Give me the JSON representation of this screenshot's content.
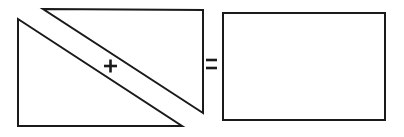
{
  "figure": {
    "background_color": "#ffffff",
    "stroke_color": "#1a1a1a",
    "fill_color": "#ffffff",
    "canvas": {
      "width": 404,
      "height": 137
    },
    "operators": [
      {
        "name": "plus",
        "symbol": "+",
        "x": 110,
        "y": 66
      },
      {
        "name": "equals",
        "symbol": "=",
        "x": 211,
        "y": 64
      }
    ],
    "shapes": [
      {
        "name": "lower-left-triangle",
        "type": "triangle",
        "label": "",
        "points": "18,19 18,126 182,126",
        "vertices": [
          [
            18,
            19
          ],
          [
            18,
            126
          ],
          [
            182,
            126
          ]
        ]
      },
      {
        "name": "upper-right-triangle",
        "type": "triangle",
        "label": "",
        "points": "43,9 203,10 203,113",
        "vertices": [
          [
            43,
            9
          ],
          [
            203,
            10
          ],
          [
            203,
            113
          ]
        ]
      },
      {
        "name": "result-rectangle",
        "type": "rectangle",
        "label": "",
        "x": 223,
        "y": 13,
        "width": 162,
        "height": 107
      }
    ]
  },
  "chart_data": {
    "type": "diagram",
    "elements": [
      "right triangle",
      "plus sign",
      "right triangle",
      "equals sign",
      "rectangle"
    ]
  }
}
